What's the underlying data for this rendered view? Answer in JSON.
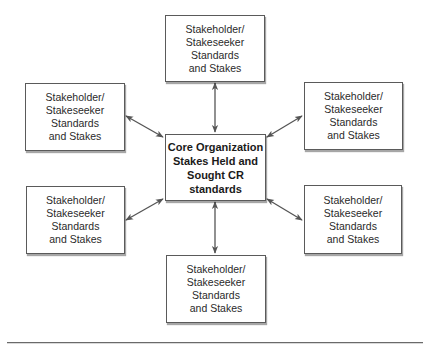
{
  "diagram": {
    "type": "hub-and-spoke",
    "center": {
      "id": "core",
      "lines": [
        "Core Organization",
        "Stakes Held and",
        "Sought CR",
        "standards"
      ]
    },
    "nodes": [
      {
        "id": "top",
        "position": "top",
        "lines": [
          "Stakeholder/",
          "Stakeseeker",
          "Standards",
          "and Stakes"
        ]
      },
      {
        "id": "upper-left",
        "position": "upper-left",
        "lines": [
          "Stakeholder/",
          "Stakeseeker",
          "Standards",
          "and Stakes"
        ]
      },
      {
        "id": "upper-right",
        "position": "upper-right",
        "lines": [
          "Stakeholder/",
          "Stakeseeker",
          "Standards",
          "and Stakes"
        ]
      },
      {
        "id": "lower-left",
        "position": "lower-left",
        "lines": [
          "Stakeholder/",
          "Stakeseeker",
          "Standards",
          "and Stakes"
        ]
      },
      {
        "id": "lower-right",
        "position": "lower-right",
        "lines": [
          "Stakeholder/",
          "Stakeseeker",
          "Standards",
          "and Stakes"
        ]
      },
      {
        "id": "bottom",
        "position": "bottom",
        "lines": [
          "Stakeholder/",
          "Stakeseeker",
          "Standards",
          "and Stakes"
        ]
      }
    ],
    "edges": [
      {
        "from": "core",
        "to": "top",
        "direction": "bidirectional"
      },
      {
        "from": "core",
        "to": "upper-left",
        "direction": "bidirectional"
      },
      {
        "from": "core",
        "to": "upper-right",
        "direction": "bidirectional"
      },
      {
        "from": "core",
        "to": "lower-left",
        "direction": "bidirectional"
      },
      {
        "from": "core",
        "to": "lower-right",
        "direction": "bidirectional"
      },
      {
        "from": "core",
        "to": "bottom",
        "direction": "bidirectional"
      }
    ],
    "colors": {
      "border": "#5a5a5a",
      "arrow": "#555555",
      "text": "#2a2a2a",
      "divider": "#6a6a6a"
    }
  }
}
